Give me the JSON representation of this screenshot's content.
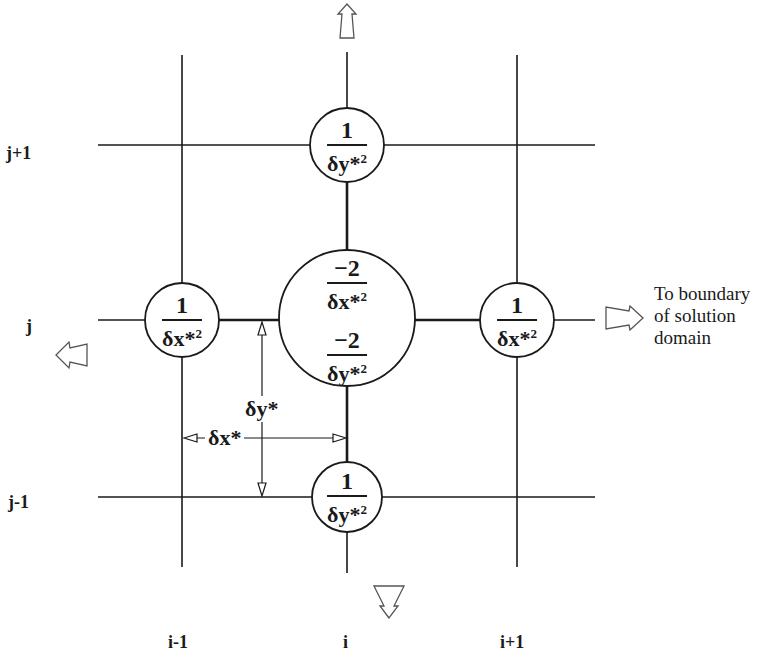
{
  "diagram": {
    "type": "five-point finite-difference stencil (computational molecule)",
    "row_labels": {
      "j_plus_1": "j+1",
      "j": "j",
      "j_minus_1": "j-1"
    },
    "column_labels": {
      "i_minus_1": "i-1",
      "i": "i",
      "i_plus_1": "i+1"
    },
    "nodes": {
      "top": {
        "numerator": "1",
        "denominator": "δy*",
        "exponent": "2"
      },
      "left": {
        "numerator": "1",
        "denominator": "δx*",
        "exponent": "2"
      },
      "center_x": {
        "numerator": "−2",
        "denominator": "δx*",
        "exponent": "2"
      },
      "center_y": {
        "numerator": "−2",
        "denominator": "δy*",
        "exponent": "2"
      },
      "right": {
        "numerator": "1",
        "denominator": "δx*",
        "exponent": "2"
      },
      "bottom": {
        "numerator": "1",
        "denominator": "δy*",
        "exponent": "2"
      }
    },
    "dimensions": {
      "dy": "δy*",
      "dx": "δx*"
    },
    "boundary_note": {
      "line1": "To boundary",
      "line2": "of solution",
      "line3": "domain"
    },
    "arrows": [
      "up",
      "left",
      "right",
      "down"
    ],
    "colors": {
      "ink": "#1a1a1a",
      "background": "#ffffff"
    }
  }
}
